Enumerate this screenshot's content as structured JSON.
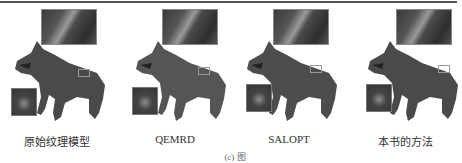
{
  "figure": {
    "panels": [
      {
        "caption": "原始纹理模型"
      },
      {
        "caption": "QEMRD"
      },
      {
        "caption": "SALOPT"
      },
      {
        "caption": "本书的方法"
      }
    ],
    "figure_label_partial": "(c) 图"
  }
}
